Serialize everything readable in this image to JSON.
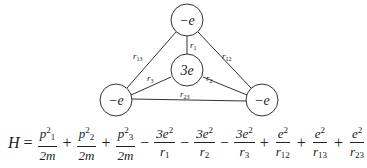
{
  "diagram": {
    "charges": {
      "top": "−e",
      "center": "3e",
      "bottom_left": "−e",
      "bottom_right": "−e"
    },
    "distances": {
      "r1": "r",
      "r1_sub": "1",
      "r2": "r",
      "r2_sub": "2",
      "r3": "r",
      "r3_sub": "3",
      "r12": "r",
      "r12_sub": "12",
      "r13": "r",
      "r13_sub": "13",
      "r23": "r",
      "r23_sub": "23"
    }
  },
  "equation": {
    "lhs": "H",
    "eq": "=",
    "terms": [
      {
        "sign": "",
        "num": "p",
        "num_sub": "1",
        "num_sup": "2",
        "den": "2m"
      },
      {
        "sign": "+",
        "num": "p",
        "num_sub": "2",
        "num_sup": "2",
        "den": "2m"
      },
      {
        "sign": "+",
        "num": "p",
        "num_sub": "3",
        "num_sup": "2",
        "den": "2m"
      },
      {
        "sign": "−",
        "num": "3e",
        "num_sup": "2",
        "den": "r",
        "den_sub": "1"
      },
      {
        "sign": "−",
        "num": "3e",
        "num_sup": "2",
        "den": "r",
        "den_sub": "2"
      },
      {
        "sign": "−",
        "num": "3e",
        "num_sup": "2",
        "den": "r",
        "den_sub": "3"
      },
      {
        "sign": "+",
        "num": "e",
        "num_sup": "2",
        "den": "r",
        "den_sub": "12"
      },
      {
        "sign": "+",
        "num": "e",
        "num_sup": "2",
        "den": "r",
        "den_sub": "13"
      },
      {
        "sign": "+",
        "num": "e",
        "num_sup": "2",
        "den": "r",
        "den_sub": "23"
      }
    ]
  }
}
